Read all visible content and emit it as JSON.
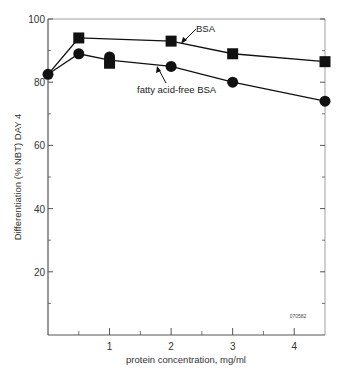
{
  "chart_data": {
    "type": "line",
    "title": "",
    "xlabel": "protein concentration, mg/ml",
    "ylabel": "Differentiation (% NBT) DAY 4",
    "xlim": [
      0,
      4.5
    ],
    "ylim": [
      0,
      100
    ],
    "x_ticks": [
      1,
      2,
      3,
      4
    ],
    "x_minor_ticks": [
      0.5,
      1.5,
      2.5,
      3.5
    ],
    "y_ticks": [
      20,
      40,
      60,
      80,
      100
    ],
    "y_minor_ticks": [
      10,
      30,
      50,
      70,
      90
    ],
    "grid": false,
    "series": [
      {
        "name": "BSA",
        "marker": "square",
        "x": [
          0,
          0.5,
          1,
          2,
          3,
          4.5
        ],
        "y": [
          82.5,
          94,
          86,
          93,
          89,
          86.5
        ],
        "line_x": [
          0,
          0.5,
          2,
          3,
          4.5
        ],
        "line_y": [
          82.5,
          94,
          93,
          89,
          86.5
        ]
      },
      {
        "name": "fatty acid-free BSA",
        "marker": "circle",
        "x": [
          0,
          0.5,
          1,
          2,
          3,
          4.5
        ],
        "y": [
          82.5,
          89,
          88,
          85,
          80,
          74
        ],
        "line_x": [
          0,
          0.5,
          1,
          2,
          3,
          4.5
        ],
        "line_y": [
          82.5,
          89,
          87,
          85,
          80,
          74
        ]
      }
    ],
    "annotations": [
      {
        "text": "BSA",
        "points_to_series": "BSA"
      },
      {
        "text": "fatty acid-free BSA",
        "points_to_series": "fatty acid-free BSA"
      },
      {
        "text": "070582",
        "position": "lower-right"
      }
    ]
  }
}
